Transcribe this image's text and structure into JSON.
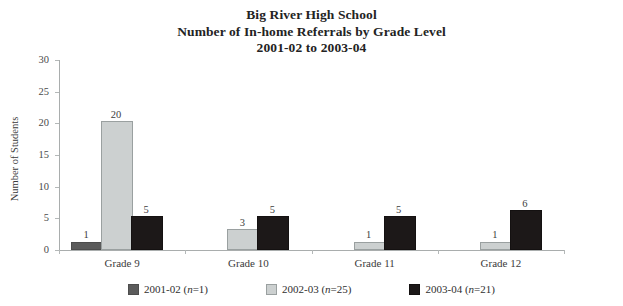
{
  "title": {
    "line1": "Big River High School",
    "line2": "Number of In-home Referrals by Grade Level",
    "line3": "2001-02 to 2003-04"
  },
  "axes": {
    "ylabel": "Number of Students",
    "yticks": [
      "0",
      "5",
      "10",
      "15",
      "20",
      "25",
      "30"
    ],
    "xlabel": ""
  },
  "legend": {
    "items": [
      {
        "label": "2001-02 (n=1)",
        "color": "#5b5b5b"
      },
      {
        "label": "2002-03 (n=25)",
        "color": "#ccd0d0"
      },
      {
        "label": "2003-04 (n=21)",
        "color": "#1c1818"
      }
    ]
  },
  "chart_data": {
    "type": "bar",
    "xlabel": "",
    "ylabel": "Number of Students",
    "ylim": [
      0,
      30
    ],
    "ytick_step": 5,
    "grid": false,
    "legend_position": "bottom",
    "categories": [
      "Grade 9",
      "Grade 10",
      "Grade 11",
      "Grade 12"
    ],
    "series": [
      {
        "name": "2001-02 (n=1)",
        "color": "#5b5b5b",
        "values": [
          1,
          0,
          0,
          0
        ]
      },
      {
        "name": "2002-03 (n=25)",
        "color": "#ccd0d0",
        "values": [
          20,
          3,
          1,
          1
        ]
      },
      {
        "name": "2003-04 (n=21)",
        "color": "#1c1818",
        "values": [
          5,
          5,
          5,
          6
        ]
      }
    ],
    "data_labels": [
      {
        "category": "Grade 9",
        "series": "2001-02 (n=1)",
        "value": 1
      },
      {
        "category": "Grade 9",
        "series": "2002-03 (n=25)",
        "value": 20
      },
      {
        "category": "Grade 9",
        "series": "2003-04 (n=21)",
        "value": 5
      },
      {
        "category": "Grade 10",
        "series": "2002-03 (n=25)",
        "value": 3
      },
      {
        "category": "Grade 10",
        "series": "2003-04 (n=21)",
        "value": 5
      },
      {
        "category": "Grade 11",
        "series": "2002-03 (n=25)",
        "value": 1
      },
      {
        "category": "Grade 11",
        "series": "2003-04 (n=21)",
        "value": 5
      },
      {
        "category": "Grade 12",
        "series": "2002-03 (n=25)",
        "value": 1
      },
      {
        "category": "Grade 12",
        "series": "2003-04 (n=21)",
        "value": 6
      }
    ]
  }
}
